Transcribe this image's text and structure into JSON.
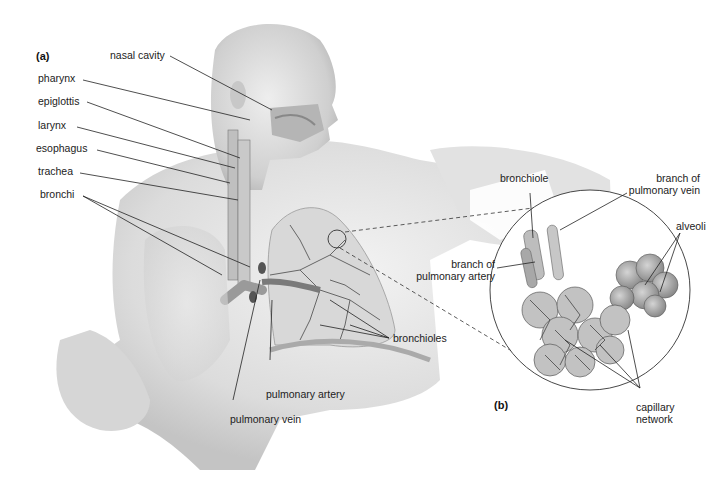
{
  "figure": {
    "panels": {
      "a": "(a)",
      "b": "(b)"
    },
    "labels_a": {
      "nasal_cavity": "nasal cavity",
      "pharynx": "pharynx",
      "epiglottis": "epiglottis",
      "larynx": "larynx",
      "esophagus": "esophagus",
      "trachea": "trachea",
      "bronchi": "bronchi",
      "bronchioles": "bronchioles",
      "pulmonary_artery": "pulmonary artery",
      "pulmonary_vein": "pulmonary vein"
    },
    "labels_b": {
      "bronchiole": "bronchiole",
      "branch_pulmonary_vein_1": "branch of",
      "branch_pulmonary_vein_2": "pulmonary vein",
      "branch_pulmonary_artery_1": "branch of",
      "branch_pulmonary_artery_2": "pulmonary artery",
      "alveoli": "alveoli",
      "capillary_network_1": "capillary",
      "capillary_network_2": "network"
    },
    "colors": {
      "background": "#ffffff",
      "skin_shading": "#d9d9d9",
      "organ_shading": "#9a9a9a",
      "line": "#222222"
    }
  }
}
